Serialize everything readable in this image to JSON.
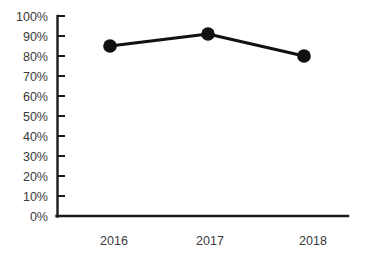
{
  "chart_data": {
    "type": "line",
    "title": "",
    "subtitle": "",
    "xlabel": "",
    "ylabel": "",
    "categories": [
      "2016",
      "2017",
      "2018"
    ],
    "values": [
      85,
      91,
      80
    ],
    "series": [
      {
        "name": "",
        "values": [
          85,
          91,
          80
        ],
        "color": "#111111",
        "marker": "circle",
        "marker_size": 13,
        "line_width": 3
      }
    ],
    "ylim": [
      0,
      100
    ],
    "y_tick_values": [
      0,
      10,
      20,
      30,
      40,
      50,
      60,
      70,
      80,
      90,
      100
    ],
    "y_tick_labels": [
      "0%",
      "10%",
      "20%",
      "30%",
      "40%",
      "50%",
      "60%",
      "70%",
      "80%",
      "90%",
      "100%"
    ],
    "x_tick_labels": [
      "2016",
      "2017",
      "2018"
    ],
    "value_format": "percent",
    "grid": false,
    "legend": false,
    "legend_position": "none",
    "axis_color": "#1a1a1a",
    "text_color": "#3a3a3a",
    "background_color": "#ffffff"
  },
  "axes": {
    "y_axis_name": "percentage-axis",
    "x_axis_name": "year-axis"
  }
}
